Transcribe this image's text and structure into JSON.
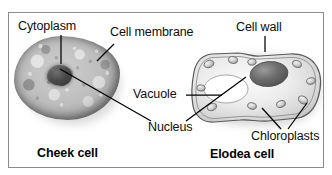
{
  "figure": {
    "background": "#ffffff",
    "frame_color": "#8b8b8b",
    "text_color": "#0d0d0d",
    "leader_color": "#000000"
  },
  "labels": {
    "cytoplasm": "Cytoplasm",
    "cell_membrane": "Cell membrane",
    "cell_wall": "Cell wall",
    "vacuole": "Vacuole",
    "nucleus": "Nucleus",
    "chloroplasts": "Chloroplasts"
  },
  "captions": {
    "left_cell": "Cheek cell",
    "right_cell": "Elodea cell"
  },
  "structures": {
    "cheek_cell": {
      "name": "cheek-cell",
      "parts": [
        "Cytoplasm",
        "Cell membrane",
        "Nucleus"
      ],
      "fill": "#bdbdbd",
      "nucleus_fill": "#3f3f3f"
    },
    "elodea_cell": {
      "name": "elodea-cell",
      "parts": [
        "Cell wall",
        "Vacuole",
        "Nucleus",
        "Chloroplasts"
      ],
      "fill": "#e8e8e8",
      "nucleus_fill": "#6a6a6a",
      "vacuole_fill": "#ffffff",
      "chloroplast_count": 9
    }
  }
}
